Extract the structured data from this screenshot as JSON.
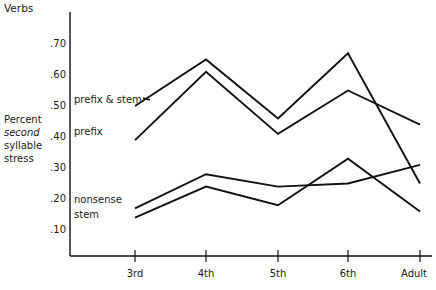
{
  "chart_data": {
    "type": "line",
    "title": "Verbs",
    "xlabel": "",
    "ylabel": "Percent second syllable stress",
    "ylabel_lines": [
      "Percent",
      "second",
      "syllable",
      "stress"
    ],
    "categories": [
      "3rd",
      "4th",
      "5th",
      "6th",
      "Adult"
    ],
    "yticks": [
      ".70",
      ".60",
      ".50",
      ".40",
      ".30",
      ".20",
      ".10"
    ],
    "ytick_values": [
      0.7,
      0.6,
      0.5,
      0.4,
      0.3,
      0.2,
      0.1
    ],
    "ylim": [
      0.0,
      0.76
    ],
    "grid": false,
    "legend": "inline-labels",
    "series": [
      {
        "name": "prefix & stem",
        "label": "prefix & stem",
        "values": [
          0.5,
          0.65,
          0.46,
          0.67,
          0.25
        ]
      },
      {
        "name": "prefix",
        "label": "prefix",
        "values": [
          0.39,
          0.61,
          0.41,
          0.55,
          0.44
        ]
      },
      {
        "name": "nonsense",
        "label": "nonsense",
        "values": [
          0.17,
          0.28,
          0.24,
          0.25,
          0.31
        ]
      },
      {
        "name": "stem",
        "label": "stem",
        "values": [
          0.14,
          0.24,
          0.18,
          0.33,
          0.16
        ]
      }
    ],
    "line_color": "#111111"
  },
  "annotations": {
    "prefix_and_stem": "prefix & stem",
    "prefix": "prefix",
    "nonsense": "nonsense",
    "stem": "stem"
  }
}
